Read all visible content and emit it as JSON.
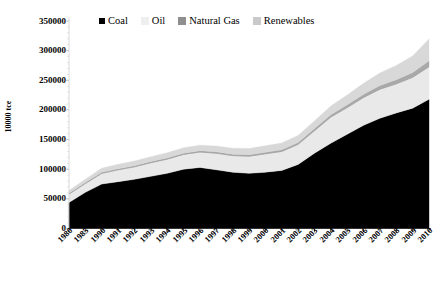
{
  "chart_data": {
    "type": "area",
    "title": "",
    "clipped_header_text": "",
    "xlabel": "",
    "ylabel": "10000 tce",
    "ylim": [
      0,
      350000
    ],
    "ytick_values": [
      0,
      50000,
      100000,
      150000,
      200000,
      250000,
      300000,
      350000
    ],
    "ytick_labels": [
      "0",
      "50000",
      "100000",
      "150000",
      "200000",
      "250000",
      "300000",
      "350000"
    ],
    "grid": false,
    "stacked": true,
    "legend_position": "top",
    "categories": [
      "1980",
      "1985",
      "1990",
      "1991",
      "1992",
      "1993",
      "1994",
      "1995",
      "1996",
      "1997",
      "1998",
      "1999",
      "2000",
      "2001",
      "2002",
      "2003",
      "2004",
      "2005",
      "2006",
      "2007",
      "2008",
      "2009",
      "2010"
    ],
    "series": [
      {
        "name": "Coal",
        "color": "#000000",
        "values": [
          44000,
          61000,
          75000,
          79000,
          83000,
          88000,
          93000,
          100000,
          103000,
          99000,
          95000,
          93000,
          95000,
          98000,
          108000,
          127000,
          144000,
          159000,
          174000,
          186000,
          195000,
          203000,
          218000
        ]
      },
      {
        "name": "Oil",
        "color": "#e9e9e9",
        "values": [
          14000,
          15000,
          18000,
          20000,
          21000,
          23000,
          24000,
          25000,
          26000,
          28000,
          28000,
          29000,
          31000,
          32000,
          34000,
          38000,
          44000,
          45000,
          47000,
          49000,
          49000,
          52000,
          55000
        ]
      },
      {
        "name": "Natural Gas",
        "color": "#a9a9a9",
        "values": [
          1500,
          1600,
          1700,
          1800,
          1900,
          1900,
          2000,
          2000,
          2200,
          2300,
          2400,
          2500,
          2700,
          2900,
          3100,
          3500,
          4000,
          4600,
          5300,
          6300,
          7100,
          8000,
          9800
        ]
      },
      {
        "name": "Renewables",
        "color": "#d8d8d8",
        "values": [
          4500,
          5500,
          7000,
          7400,
          7800,
          8200,
          8600,
          9000,
          9400,
          9700,
          10000,
          10400,
          10900,
          11300,
          11800,
          13000,
          14500,
          16500,
          18500,
          21000,
          24000,
          28000,
          37000
        ]
      }
    ]
  },
  "legend": {
    "items": [
      {
        "label": "Coal",
        "color": "#000000"
      },
      {
        "label": "Oil",
        "color": "#efefef"
      },
      {
        "label": "Natural Gas",
        "color": "#8f8f8f"
      },
      {
        "label": "Renewables",
        "color": "#c9c9c9"
      }
    ]
  },
  "axes": {
    "y_title": "10000 tce"
  }
}
